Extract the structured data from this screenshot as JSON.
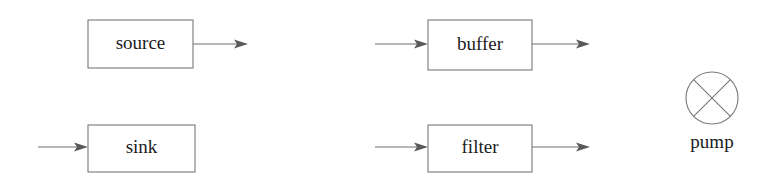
{
  "diagram": {
    "canvas": {
      "width": 780,
      "height": 190,
      "background": "#ffffff"
    },
    "stroke_color": "#787878",
    "text_color": "#1c1c1c",
    "nodes": [
      {
        "id": "source",
        "label": "source",
        "shape": "rectangle",
        "x": 88,
        "y": 20,
        "width": 105,
        "height": 48,
        "inputs": 0,
        "outputs": 1
      },
      {
        "id": "sink",
        "label": "sink",
        "shape": "rectangle",
        "x": 88,
        "y": 125,
        "width": 107,
        "height": 47,
        "inputs": 1,
        "outputs": 0
      },
      {
        "id": "buffer",
        "label": "buffer",
        "shape": "rectangle",
        "x": 428,
        "y": 20,
        "width": 104,
        "height": 50,
        "inputs": 1,
        "outputs": 1
      },
      {
        "id": "filter",
        "label": "filter",
        "shape": "rectangle",
        "x": 428,
        "y": 125,
        "width": 104,
        "height": 47,
        "inputs": 1,
        "outputs": 1
      },
      {
        "id": "pump",
        "label": "pump",
        "shape": "circle-with-cross",
        "cx": 712,
        "cy": 98,
        "r": 26,
        "label_x": 712,
        "label_y": 144,
        "inputs": 0,
        "outputs": 0
      }
    ],
    "arrows": [
      {
        "id": "source-out",
        "from_x": 193,
        "to_x": 248,
        "y": 44,
        "direction": "right"
      },
      {
        "id": "sink-in",
        "from_x": 38,
        "to_x": 88,
        "y": 147,
        "direction": "right"
      },
      {
        "id": "buffer-in",
        "from_x": 375,
        "to_x": 428,
        "y": 44,
        "direction": "right"
      },
      {
        "id": "buffer-out",
        "from_x": 532,
        "to_x": 590,
        "y": 44,
        "direction": "right"
      },
      {
        "id": "filter-in",
        "from_x": 375,
        "to_x": 428,
        "y": 147,
        "direction": "right"
      },
      {
        "id": "filter-out",
        "from_x": 532,
        "to_x": 590,
        "y": 147,
        "direction": "right"
      }
    ]
  }
}
